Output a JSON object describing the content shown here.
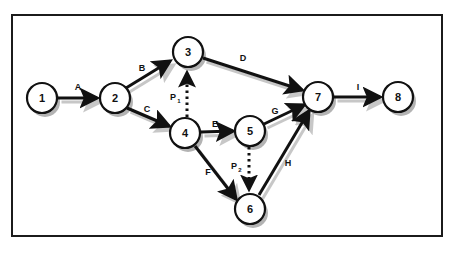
{
  "figure": {
    "type": "activity-on-arrow-network-diagram",
    "frame_border_color": "#1b1b1b",
    "background_color": "#ffffff",
    "node_fill": "#ffffff",
    "node_stroke": "#111111",
    "shadow_color": "#9a9a9a",
    "arrow_color": "#111111"
  },
  "nodes": [
    {
      "id": "1",
      "label": "1",
      "cx": 42,
      "cy": 98,
      "r": 15
    },
    {
      "id": "2",
      "label": "2",
      "cx": 115,
      "cy": 98,
      "r": 15
    },
    {
      "id": "3",
      "label": "3",
      "cx": 188,
      "cy": 52,
      "r": 15
    },
    {
      "id": "4",
      "label": "4",
      "cx": 185,
      "cy": 133,
      "r": 15
    },
    {
      "id": "5",
      "label": "5",
      "cx": 250,
      "cy": 131,
      "r": 15
    },
    {
      "id": "6",
      "label": "6",
      "cx": 250,
      "cy": 209,
      "r": 15
    },
    {
      "id": "7",
      "label": "7",
      "cx": 318,
      "cy": 97,
      "r": 15
    },
    {
      "id": "8",
      "label": "8",
      "cx": 398,
      "cy": 97,
      "r": 15
    }
  ],
  "edges": [
    {
      "id": "A",
      "label": "A",
      "from": "1",
      "to": "2",
      "style": "solid",
      "label_x": 78,
      "label_y": 87
    },
    {
      "id": "B",
      "label": "B",
      "from": "2",
      "to": "3",
      "style": "solid",
      "label_x": 142,
      "label_y": 68
    },
    {
      "id": "C",
      "label": "C",
      "from": "2",
      "to": "4",
      "style": "solid",
      "label_x": 147,
      "label_y": 109
    },
    {
      "id": "D",
      "label": "D",
      "from": "3",
      "to": "7",
      "style": "solid",
      "label_x": 243,
      "label_y": 58
    },
    {
      "id": "E",
      "label": "E",
      "from": "4",
      "to": "5",
      "style": "solid",
      "label_x": 215,
      "label_y": 124
    },
    {
      "id": "F",
      "label": "F",
      "from": "4",
      "to": "6",
      "style": "solid",
      "label_x": 208,
      "label_y": 172
    },
    {
      "id": "G",
      "label": "G",
      "from": "5",
      "to": "7",
      "style": "solid",
      "label_x": 275,
      "label_y": 111
    },
    {
      "id": "H",
      "label": "H",
      "from": "6",
      "to": "7",
      "style": "solid",
      "label_x": 288,
      "label_y": 163
    },
    {
      "id": "I",
      "label": "I",
      "from": "7",
      "to": "8",
      "style": "solid",
      "label_x": 358,
      "label_y": 87
    }
  ],
  "dummy_edges": [
    {
      "id": "P1",
      "label": "P",
      "subscript": "1",
      "from": "4",
      "to": "3",
      "style": "dotted",
      "direction": "up",
      "label_x": 173,
      "label_y": 97
    },
    {
      "id": "P2",
      "label": "P",
      "subscript": "2",
      "from": "5",
      "to": "6",
      "style": "dotted",
      "direction": "down",
      "label_x": 234,
      "label_y": 166
    }
  ]
}
